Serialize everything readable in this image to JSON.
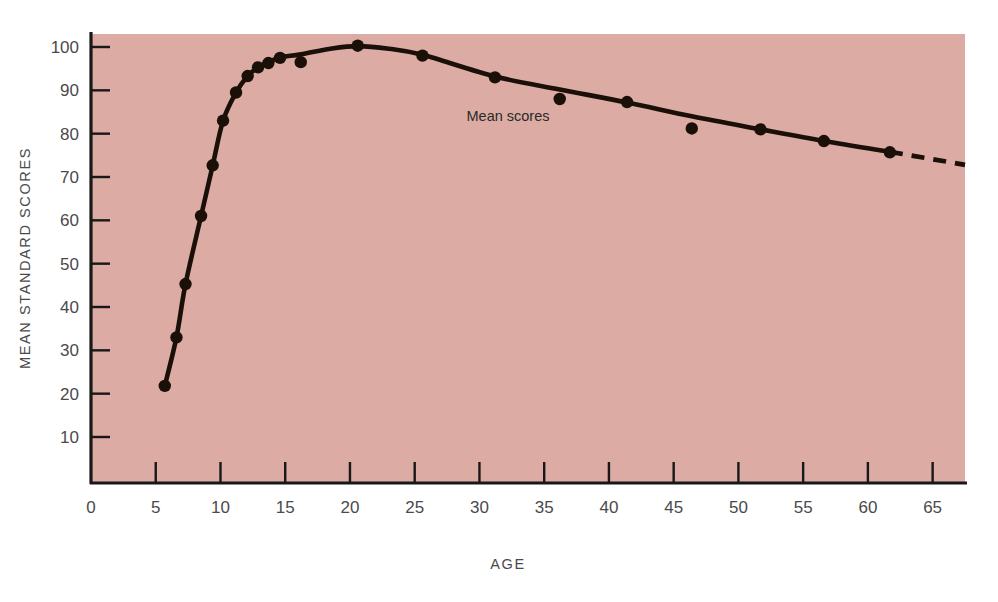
{
  "chart_data": {
    "type": "scatter",
    "title": "",
    "subtitle": "",
    "xlabel": "AGE",
    "ylabel": "MEAN STANDARD SCORES",
    "xlim": [
      0,
      67.5
    ],
    "ylim": [
      0,
      104
    ],
    "grid": false,
    "legend_position": "inline-annotation",
    "plot_background_color": "#dcaba3",
    "series_color": "#1a1008",
    "axis_color": "#181818",
    "xticks": [
      0,
      5,
      10,
      15,
      20,
      25,
      30,
      35,
      40,
      45,
      50,
      55,
      60,
      65
    ],
    "xtick_labels": [
      "0",
      "5",
      "10",
      "15",
      "20",
      "25",
      "30",
      "35",
      "40",
      "45",
      "50",
      "55",
      "60",
      "65"
    ],
    "yticks": [
      10,
      20,
      30,
      40,
      50,
      60,
      70,
      80,
      90,
      100
    ],
    "ytick_labels": [
      "10",
      "20",
      "30",
      "40",
      "50",
      "60",
      "70",
      "80",
      "90",
      "100"
    ],
    "annotations": [
      {
        "text": "Mean scores",
        "x": 29.0,
        "y": 83.0
      }
    ],
    "series": [
      {
        "name": "Mean scores",
        "marker": "filled-circle",
        "line": "solid-with-dashed-extension",
        "points": [
          {
            "x": 5.7,
            "y": 21.8
          },
          {
            "x": 6.6,
            "y": 33.0
          },
          {
            "x": 7.3,
            "y": 45.3
          },
          {
            "x": 8.5,
            "y": 61.0
          },
          {
            "x": 9.4,
            "y": 72.7
          },
          {
            "x": 10.2,
            "y": 83.0
          },
          {
            "x": 11.2,
            "y": 89.5
          },
          {
            "x": 12.1,
            "y": 93.3
          },
          {
            "x": 12.9,
            "y": 95.3
          },
          {
            "x": 13.7,
            "y": 96.3
          },
          {
            "x": 14.6,
            "y": 97.5
          },
          {
            "x": 16.2,
            "y": 96.5
          },
          {
            "x": 20.6,
            "y": 100.3
          },
          {
            "x": 25.6,
            "y": 98.0
          },
          {
            "x": 31.2,
            "y": 93.0
          },
          {
            "x": 36.2,
            "y": 88.0
          },
          {
            "x": 41.4,
            "y": 87.3
          },
          {
            "x": 46.4,
            "y": 81.2
          },
          {
            "x": 51.7,
            "y": 81.0
          },
          {
            "x": 56.6,
            "y": 78.3
          },
          {
            "x": 61.7,
            "y": 75.7
          }
        ],
        "curve_solid": [
          {
            "x": 5.7,
            "y": 21.8
          },
          {
            "x": 6.6,
            "y": 33.0
          },
          {
            "x": 7.3,
            "y": 45.3
          },
          {
            "x": 8.5,
            "y": 61.0
          },
          {
            "x": 9.4,
            "y": 72.7
          },
          {
            "x": 10.2,
            "y": 83.0
          },
          {
            "x": 11.2,
            "y": 89.5
          },
          {
            "x": 12.1,
            "y": 93.3
          },
          {
            "x": 12.9,
            "y": 95.3
          },
          {
            "x": 13.7,
            "y": 96.5
          },
          {
            "x": 14.6,
            "y": 97.6
          },
          {
            "x": 16.2,
            "y": 98.3
          },
          {
            "x": 18.5,
            "y": 99.6
          },
          {
            "x": 20.6,
            "y": 100.2
          },
          {
            "x": 23.0,
            "y": 99.6
          },
          {
            "x": 25.6,
            "y": 98.2
          },
          {
            "x": 31.2,
            "y": 93.2
          },
          {
            "x": 36.2,
            "y": 90.2
          },
          {
            "x": 41.4,
            "y": 87.2
          },
          {
            "x": 46.4,
            "y": 84.0
          },
          {
            "x": 51.7,
            "y": 81.0
          },
          {
            "x": 56.6,
            "y": 78.3
          },
          {
            "x": 61.7,
            "y": 75.8
          }
        ],
        "curve_dashed": [
          {
            "x": 61.7,
            "y": 75.8
          },
          {
            "x": 67.5,
            "y": 72.8
          }
        ]
      }
    ]
  },
  "figure": {
    "x_axis_title": "AGE",
    "y_axis_title": "MEAN STANDARD SCORES",
    "inline_label": "Mean scores"
  }
}
